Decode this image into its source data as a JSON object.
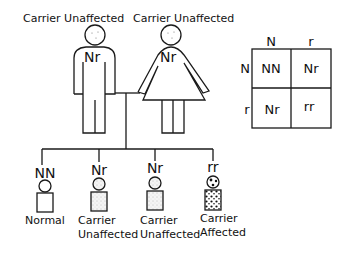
{
  "parents": {
    "father": {
      "status": "Carrier Unaffected",
      "genotype": "Nr"
    },
    "mother": {
      "status": "Carrier Unaffected",
      "genotype": "Nr"
    }
  },
  "children": [
    {
      "genotype": "NN",
      "label_line1": "Normal",
      "label_line2": "",
      "fill": "none"
    },
    {
      "genotype": "Nr",
      "label_line1": "Carrier",
      "label_line2": "Unaffected",
      "fill": "light-stipple"
    },
    {
      "genotype": "Nr",
      "label_line1": "Carrier",
      "label_line2": "Unaffected",
      "fill": "light-stipple"
    },
    {
      "genotype": "rr",
      "label_line1": "Carrier",
      "label_line2": "Affected",
      "fill": "heavy-stipple"
    }
  ],
  "punnett": {
    "col_headers": [
      "N",
      "r"
    ],
    "row_headers": [
      "N",
      "r"
    ],
    "cells": [
      [
        "NN",
        "Nr"
      ],
      [
        "Nr",
        "rr"
      ]
    ]
  }
}
